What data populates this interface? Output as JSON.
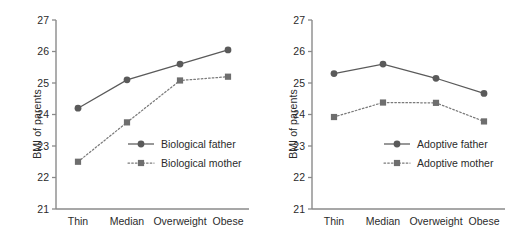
{
  "figure": {
    "background": "#ffffff",
    "line_color": "#5a5a5a",
    "dotted_color": "#7a7a7a",
    "axis_color": "#8a8a8a",
    "text_color": "#2b2b2b",
    "caption": ""
  },
  "axis": {
    "ylabel": "BMI of parents",
    "yticks": [
      "27",
      "26",
      "25",
      "24",
      "23",
      "22",
      "21"
    ],
    "xticks": [
      "Thin",
      "Median",
      "Overweight",
      "Obese"
    ]
  },
  "panels": [
    {
      "id": "left",
      "legend": [
        {
          "label": "Biological father",
          "marker": "circle",
          "style": "solid"
        },
        {
          "label": "Biological mother",
          "marker": "square",
          "style": "dotted"
        }
      ]
    },
    {
      "id": "right",
      "legend": [
        {
          "label": "Adoptive father",
          "marker": "circle",
          "style": "solid"
        },
        {
          "label": "Adoptive mother",
          "marker": "square",
          "style": "dotted"
        }
      ]
    }
  ],
  "chart_data": [
    {
      "type": "line",
      "panel": "left",
      "title": "",
      "xlabel": "",
      "ylabel": "BMI of parents",
      "categories": [
        "Thin",
        "Median",
        "Overweight",
        "Obese"
      ],
      "ylim": [
        21,
        27
      ],
      "ytick_values": [
        21,
        22,
        23,
        24,
        25,
        26,
        27
      ],
      "grid": false,
      "legend_position": "inside-lower-right",
      "series": [
        {
          "name": "Biological father",
          "marker": "circle",
          "linestyle": "solid",
          "color": "#5a5a5a",
          "values": [
            24.2,
            25.1,
            25.6,
            26.05
          ]
        },
        {
          "name": "Biological mother",
          "marker": "square",
          "linestyle": "dotted",
          "color": "#7a7a7a",
          "values": [
            22.5,
            23.75,
            25.08,
            25.2
          ]
        }
      ]
    },
    {
      "type": "line",
      "panel": "right",
      "title": "",
      "xlabel": "",
      "ylabel": "BMI of parents",
      "categories": [
        "Thin",
        "Median",
        "Overweight",
        "Obese"
      ],
      "ylim": [
        21,
        27
      ],
      "ytick_values": [
        21,
        22,
        23,
        24,
        25,
        26,
        27
      ],
      "grid": false,
      "legend_position": "inside-lower-right",
      "series": [
        {
          "name": "Adoptive father",
          "marker": "circle",
          "linestyle": "solid",
          "color": "#5a5a5a",
          "values": [
            25.3,
            25.6,
            25.15,
            24.67
          ]
        },
        {
          "name": "Adoptive mother",
          "marker": "square",
          "linestyle": "dotted",
          "color": "#7a7a7a",
          "values": [
            23.92,
            24.38,
            24.37,
            23.78
          ]
        }
      ]
    }
  ]
}
